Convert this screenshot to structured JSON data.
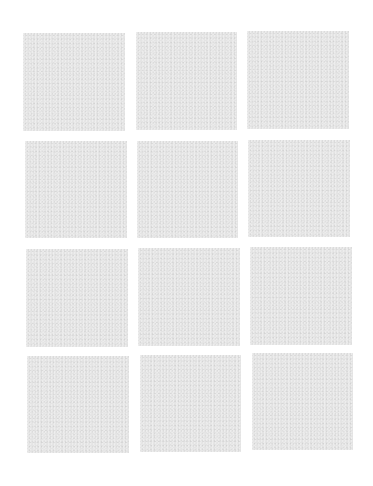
{
  "canvas": {
    "width": 373,
    "height": 486,
    "background_color": "#ffffff"
  },
  "grid": {
    "rows": 4,
    "columns": 3,
    "tile_color": "#e4e4e4",
    "tile_texture": "fine noise",
    "tiles": [
      {
        "row": 1,
        "col": 1,
        "x": 23,
        "y": 33,
        "w": 102,
        "h": 98
      },
      {
        "row": 1,
        "col": 2,
        "x": 136,
        "y": 32,
        "w": 101,
        "h": 98
      },
      {
        "row": 1,
        "col": 3,
        "x": 247,
        "y": 31,
        "w": 102,
        "h": 98
      },
      {
        "row": 2,
        "col": 1,
        "x": 25,
        "y": 141,
        "w": 102,
        "h": 97
      },
      {
        "row": 2,
        "col": 2,
        "x": 137,
        "y": 141,
        "w": 101,
        "h": 97
      },
      {
        "row": 2,
        "col": 3,
        "x": 248,
        "y": 140,
        "w": 102,
        "h": 97
      },
      {
        "row": 3,
        "col": 1,
        "x": 26,
        "y": 249,
        "w": 102,
        "h": 98
      },
      {
        "row": 3,
        "col": 2,
        "x": 138,
        "y": 248,
        "w": 102,
        "h": 98
      },
      {
        "row": 3,
        "col": 3,
        "x": 250,
        "y": 247,
        "w": 102,
        "h": 98
      },
      {
        "row": 4,
        "col": 1,
        "x": 27,
        "y": 356,
        "w": 102,
        "h": 97
      },
      {
        "row": 4,
        "col": 2,
        "x": 140,
        "y": 355,
        "w": 101,
        "h": 97
      },
      {
        "row": 4,
        "col": 3,
        "x": 252,
        "y": 353,
        "w": 101,
        "h": 97
      }
    ]
  }
}
